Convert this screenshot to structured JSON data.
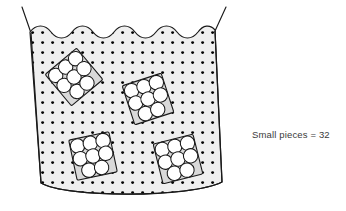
{
  "figure": {
    "type": "illustration",
    "caption_label": "Small pieces = 32"
  },
  "legend": {
    "text": "Small pieces = 32",
    "term": "Small pieces",
    "equals": "=",
    "count": "32"
  },
  "container": {
    "name": "tub",
    "fill_color": "#efefef",
    "stroke_color": "#1a1a1a",
    "texture": "black-dot-grid",
    "dot_color": "#000000",
    "top_edge": "wavy",
    "bottom_edge": "curved",
    "side_edges": "slanted-straight",
    "rim_lines": "two-straight-slanted-lines"
  },
  "groups": {
    "count": 4,
    "pieces_per_group": 8,
    "total_pieces": 32,
    "piece_fill": "#ffffff",
    "piece_stroke": "#1a1a1a",
    "items": [
      {
        "id": "group-1",
        "label": "top-left cluster",
        "pieces": 8,
        "cx": 74,
        "cy": 77,
        "rotation": -40
      },
      {
        "id": "group-2",
        "label": "upper-right cluster",
        "pieces": 8,
        "cx": 148,
        "cy": 99,
        "rotation": -18
      },
      {
        "id": "group-3",
        "label": "bottom-left cluster",
        "pieces": 8,
        "cx": 93,
        "cy": 156,
        "rotation": -12
      },
      {
        "id": "group-4",
        "label": "bottom-right cluster",
        "pieces": 8,
        "cx": 178,
        "cy": 159,
        "rotation": -14
      }
    ]
  },
  "colors": {
    "background": "#ffffff",
    "ink": "#1a1a1a",
    "fill": "#efefef",
    "text": "#3a3a3a"
  }
}
